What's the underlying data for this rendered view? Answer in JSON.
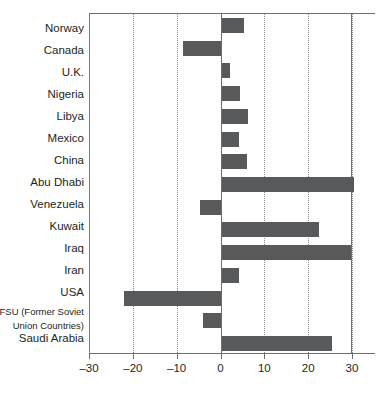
{
  "chart_data": {
    "type": "bar",
    "orientation": "horizontal",
    "title": "",
    "xlabel": "",
    "ylabel": "",
    "xlim": [
      -30,
      30
    ],
    "xticks": [
      -30,
      -20,
      -10,
      0,
      10,
      20,
      30
    ],
    "xtick_labels": [
      "–30",
      "–20",
      "–10",
      "0",
      "10",
      "20",
      "30"
    ],
    "grid": true,
    "grid_axis": "x",
    "legend": null,
    "bar_color": "#58595b",
    "categories": [
      "Norway",
      "Canada",
      "U.K.",
      "Nigeria",
      "Libya",
      "Mexico",
      "China",
      "Abu Dhabi",
      "Venezuela",
      "Kuwait",
      "Iraq",
      "Iran",
      "USA",
      "FSU (Former Soviet Union Countries)",
      "Saudi Arabia"
    ],
    "values": [
      5.1,
      -8.8,
      2.0,
      4.3,
      6.0,
      3.9,
      5.9,
      30.3,
      -4.9,
      22.2,
      29.6,
      3.9,
      -22.3,
      -4.2,
      25.2
    ]
  },
  "labels": {
    "norway": "Norway",
    "canada": "Canada",
    "uk": "U.K.",
    "nigeria": "Nigeria",
    "libya": "Libya",
    "mexico": "Mexico",
    "china": "China",
    "abu_dhabi": "Abu Dhabi",
    "venezuela": "Venezuela",
    "kuwait": "Kuwait",
    "iraq": "Iraq",
    "iran": "Iran",
    "usa": "USA",
    "fsu_line1": "FSU (Former Soviet",
    "fsu_line2": "Union Countries)",
    "saudi_arabia": "Saudi Arabia"
  },
  "axis": {
    "tick_labels": [
      "–30",
      "–20",
      "–10",
      "0",
      "10",
      "20",
      "30"
    ]
  }
}
